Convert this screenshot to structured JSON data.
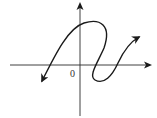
{
  "diagram": {
    "type": "coordinate-plane-curve",
    "origin_label": "0",
    "axes": {
      "x_axis": {
        "y": 65,
        "x_start": 10,
        "x_end": 152,
        "arrow": "right"
      },
      "y_axis": {
        "x": 80,
        "y_start": 2,
        "y_end": 116,
        "arrow": "up"
      }
    },
    "curve": {
      "path": "M 42 81 C 55 55, 68 28, 84 23 C 100 18, 112 25, 104 48 C 98 62, 88 76, 95 80 C 104 85, 112 76, 118 63 C 124 50, 130 42, 139 37",
      "start_arrow": true,
      "end_arrow": true,
      "color": "#1a1a1a"
    },
    "colors": {
      "background": "#ffffff",
      "axis": "#2a2a2a",
      "curve": "#1a1a1a"
    }
  }
}
